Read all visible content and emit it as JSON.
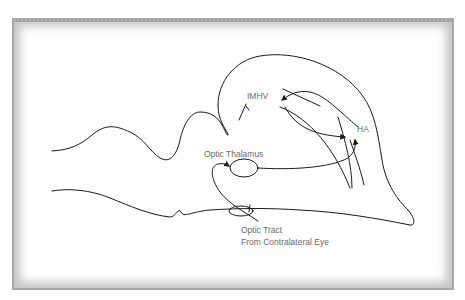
{
  "diagram": {
    "type": "brain-pathway-schematic",
    "labels": {
      "imhv": "IMHV",
      "ha": "HA",
      "optic_thalamus": "Optic Thalamus",
      "optic_tract_line1": "Optic Tract",
      "optic_tract_line2": "From Contralateral Eye"
    },
    "nodes": [
      {
        "id": "imhv",
        "label": "IMHV"
      },
      {
        "id": "ha",
        "label": "HA"
      },
      {
        "id": "optic_thalamus",
        "label": "Optic Thalamus"
      },
      {
        "id": "optic_tract",
        "label": "Optic Tract From Contralateral Eye"
      }
    ],
    "edges": [
      {
        "from": "optic_tract",
        "to": "optic_thalamus"
      },
      {
        "from": "optic_thalamus",
        "to": "ha"
      },
      {
        "from": "ha",
        "to": "imhv"
      },
      {
        "from": "imhv",
        "to": "ha"
      }
    ],
    "colors": {
      "stroke": "#1a1a1a",
      "label": "#6a6a6a",
      "frame": "#a8a8a8",
      "background": "#ffffff"
    }
  }
}
